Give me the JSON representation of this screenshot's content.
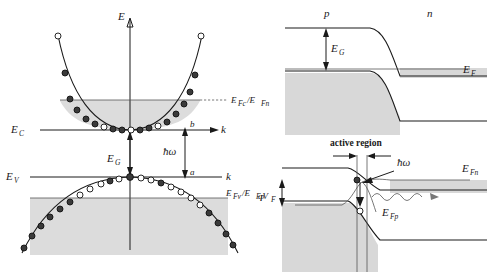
{
  "figure": {
    "title": "",
    "panels": [
      {
        "id": "left-ek",
        "name": "E-k band diagram with carrier occupation",
        "labels": {
          "energy_axis": "E",
          "k_axis_upper": "k",
          "k_axis_lower": "k",
          "conduction_edge": "E",
          "conduction_edge_sub": "C",
          "valence_edge": "E",
          "valence_edge_sub": "V",
          "quasi_fermi_n": "E",
          "quasi_fermi_n_sub1": "Fc",
          "quasi_fermi_n_mid": "/E",
          "quasi_fermi_n_sub2": "Fn",
          "quasi_fermi_p": "E",
          "quasi_fermi_p_sub1": "Fv",
          "quasi_fermi_p_mid": "/E",
          "quasi_fermi_p_sub2": "Fp",
          "bandgap": "E",
          "bandgap_sub": "G",
          "photon": "ħω",
          "point_upper": "b",
          "point_lower": "a"
        }
      },
      {
        "id": "top-right-junction",
        "name": "p-n junction band diagram at equilibrium",
        "labels": {
          "p_side": "p",
          "n_side": "n",
          "bandgap": "E",
          "bandgap_sub": "G",
          "fermi": "E",
          "fermi_sub": "F"
        }
      },
      {
        "id": "bottom-right-junction",
        "name": "forward biased junction with active region",
        "labels": {
          "active_region": "active region",
          "photon": "ħω",
          "bias": "qV",
          "bias_sub": "F",
          "quasi_fermi_n": "E",
          "quasi_fermi_n_sub": "Fn",
          "quasi_fermi_p": "E",
          "quasi_fermi_p_sub": "Fp"
        }
      }
    ],
    "colors": {
      "shade": "#dcdcdc",
      "line": "#1a1a1a",
      "electron": "#3a3a3a",
      "hole": "#ffffff",
      "background": "#ffffff"
    }
  }
}
